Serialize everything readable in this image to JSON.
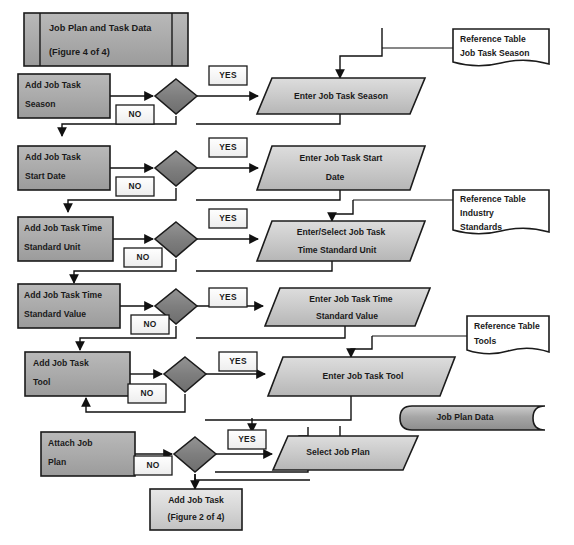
{
  "diagram": {
    "title": "Job Plan and Task Data",
    "title_sub": "(Figure 4 of 4)",
    "labels": {
      "yes": "YES",
      "no": "NO"
    },
    "rows": [
      {
        "id": "season",
        "process_line1": "Add Job Task",
        "process_line2": "Season",
        "decision": "",
        "yes_label": "YES",
        "no_label": "NO",
        "io_line1": "Enter Job Task Season",
        "io_line2": "",
        "reference_line1": "Reference Table",
        "reference_line2": "Job Task Season",
        "reference_line3": ""
      },
      {
        "id": "start-date",
        "process_line1": "Add Job Task",
        "process_line2": "Start Date",
        "decision": "",
        "yes_label": "YES",
        "no_label": "NO",
        "io_line1": "Enter Job Task Start",
        "io_line2": "Date",
        "reference_line1": "",
        "reference_line2": "",
        "reference_line3": ""
      },
      {
        "id": "time-standard-unit",
        "process_line1": "Add Job Task Time",
        "process_line2": "Standard Unit",
        "decision": "",
        "yes_label": "YES",
        "no_label": "NO",
        "io_line1": "Enter/Select Job Task",
        "io_line2": "Time Standard Unit",
        "reference_line1": "Reference Table",
        "reference_line2": "Industry",
        "reference_line3": "Standards"
      },
      {
        "id": "time-standard-value",
        "process_line1": "Add Job Task Time",
        "process_line2": "Standard Value",
        "decision": "",
        "yes_label": "YES",
        "no_label": "NO",
        "io_line1": "Enter Job Task Time",
        "io_line2": "Standard Value",
        "reference_line1": "",
        "reference_line2": "",
        "reference_line3": ""
      },
      {
        "id": "tool",
        "process_line1": "Add Job Task",
        "process_line2": "Tool",
        "decision": "",
        "yes_label": "YES",
        "no_label": "NO",
        "io_line1": "Enter Job Task Tool",
        "io_line2": "",
        "reference_line1": "Reference Table",
        "reference_line2": "Tools",
        "reference_line3": ""
      },
      {
        "id": "attach-job-plan",
        "process_line1": "Attach Job",
        "process_line2": "Plan",
        "decision": "",
        "yes_label": "YES",
        "no_label": "NO",
        "io_line1": "Select Job Plan",
        "io_line2": "",
        "reference_line1": "",
        "reference_line2": "",
        "reference_line3": ""
      }
    ],
    "datastore": {
      "label": "Job Plan Data"
    },
    "terminator": {
      "line1": "Add Job Task",
      "line2": "(Figure 2 of 4)"
    },
    "colors": {
      "process_fill": "#a8a8a8",
      "decision_fill": "#7d7d7d",
      "io_fill": "#c9c9c9",
      "label_fill": "#fefefe",
      "document_fill": "#ffffff",
      "stroke": "#1b1b1b",
      "text": "#1a1a1a",
      "background": "#ffffff"
    }
  }
}
